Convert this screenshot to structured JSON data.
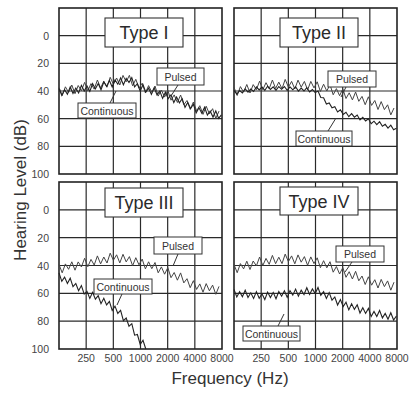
{
  "chart_data": {
    "type": "line",
    "title": "",
    "xlabel": "Frequency (Hz)",
    "ylabel": "Hearing Level (dB)",
    "x_ticks": [
      "250",
      "500",
      "1000",
      "2000",
      "4000",
      "8000"
    ],
    "y_ticks": [
      "0",
      "20",
      "40",
      "60",
      "80",
      "100"
    ],
    "ylim": [
      -20,
      100
    ],
    "y_inverted": true,
    "x_scale": "log2",
    "xlim": [
      125,
      8000
    ],
    "grid": true,
    "legend_position": "inline labels",
    "panels": [
      {
        "name": "Type I",
        "series": [
          {
            "name": "Pulsed",
            "x": [
              125,
              250,
              500,
              750,
              1000,
              2000,
              4000,
              8000
            ],
            "values": [
              40,
              37,
              33,
              31,
              37,
              43,
              52,
              58
            ]
          },
          {
            "name": "Continuous",
            "x": [
              125,
              250,
              500,
              750,
              1000,
              2000,
              4000,
              8000
            ],
            "values": [
              41,
              38,
              34,
              32,
              38,
              44,
              53,
              59
            ]
          }
        ],
        "annotations": [
          "Pulsed",
          "Continuous"
        ]
      },
      {
        "name": "Type II",
        "series": [
          {
            "name": "Pulsed",
            "x": [
              125,
              250,
              500,
              1000,
              2000,
              4000,
              8000
            ],
            "values": [
              40,
              36,
              35,
              36,
              42,
              48,
              56
            ]
          },
          {
            "name": "Continuous",
            "x": [
              125,
              250,
              500,
              1000,
              1400,
              2000,
              4000,
              8000
            ],
            "values": [
              41,
              38,
              38,
              40,
              50,
              56,
              62,
              68
            ]
          }
        ],
        "annotations": [
          "Pulsed",
          "Continuous"
        ]
      },
      {
        "name": "Type III",
        "series": [
          {
            "name": "Pulsed",
            "x": [
              125,
              250,
              500,
              1000,
              2000,
              4000,
              8000
            ],
            "values": [
              42,
              38,
              34,
              38,
              45,
              55,
              58
            ]
          },
          {
            "name": "Continuous",
            "x": [
              125,
              250,
              500,
              750,
              1000,
              1200
            ],
            "values": [
              48,
              60,
              70,
              82,
              95,
              100
            ]
          }
        ],
        "annotations": [
          "Pulsed",
          "Continuous"
        ]
      },
      {
        "name": "Type IV",
        "series": [
          {
            "name": "Pulsed",
            "x": [
              125,
              250,
              500,
              1000,
              2000,
              4000,
              8000
            ],
            "values": [
              42,
              37,
              35,
              37,
              45,
              52,
              55
            ]
          },
          {
            "name": "Continuous",
            "x": [
              125,
              250,
              500,
              1000,
              2000,
              4000,
              8000
            ],
            "values": [
              60,
              62,
              60,
              58,
              68,
              74,
              78
            ]
          }
        ],
        "annotations": [
          "Pulsed",
          "Continuous"
        ]
      }
    ]
  },
  "labels": {
    "ylabel": "Hearing Level (dB)",
    "xlabel": "Frequency (Hz)",
    "pulsed": "Pulsed",
    "continuous": "Continuous"
  }
}
